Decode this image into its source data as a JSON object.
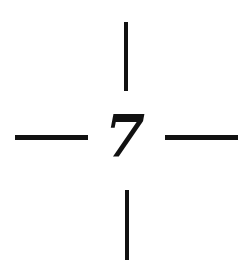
{
  "figure": {
    "numeral": "7",
    "colors": {
      "stroke": "#111111",
      "background": "#ffffff"
    },
    "segments": [
      {
        "id": "top",
        "orientation": "vertical"
      },
      {
        "id": "left",
        "orientation": "horizontal"
      },
      {
        "id": "right",
        "orientation": "horizontal"
      },
      {
        "id": "bottom",
        "orientation": "vertical"
      }
    ]
  }
}
